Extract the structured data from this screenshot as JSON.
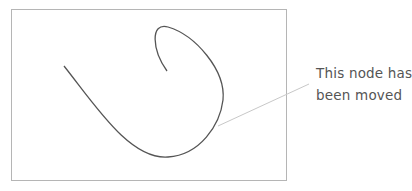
{
  "diagram": {
    "frame": {
      "x": 11,
      "y": 9,
      "width": 275,
      "height": 171,
      "stroke": "#b5b5b5"
    },
    "curve": {
      "stroke": "#555555",
      "description": "bezier path forming a hook/loop"
    },
    "callout": {
      "line_from": [
        218,
        126
      ],
      "line_to": [
        309,
        84
      ],
      "line_color": "#c8c8c8",
      "text_lines": [
        "This node has",
        "been moved"
      ]
    }
  }
}
